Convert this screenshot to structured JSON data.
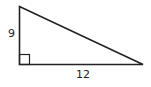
{
  "diagram": {
    "type": "right-triangle",
    "labels": {
      "vertical_leg": "9",
      "horizontal_leg": "12"
    },
    "right_angle_marker": true,
    "stroke_color": "#222222"
  }
}
